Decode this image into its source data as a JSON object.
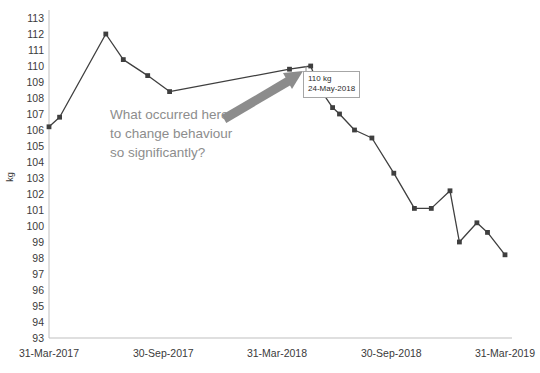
{
  "chart_data": {
    "type": "line",
    "title": "",
    "xlabel": "",
    "ylabel": "kg",
    "ylim": [
      93,
      113
    ],
    "grid": false,
    "legend": "none",
    "y_ticks": [
      113,
      112,
      111,
      110,
      109,
      108,
      107,
      106,
      105,
      104,
      103,
      102,
      101,
      100,
      99,
      98,
      97,
      96,
      95,
      94,
      93
    ],
    "x_ticks": [
      "31-Mar-2017",
      "30-Sep-2017",
      "31-Mar-2018",
      "30-Sep-2018",
      "31-Mar-2019"
    ],
    "x_range": [
      "31-Mar-2017",
      "31-Mar-2019"
    ],
    "series": [
      {
        "name": "Weight",
        "marker": "square",
        "color": "#3f3f3f",
        "points": [
          {
            "x": "31-Mar-2017",
            "y": 106.2
          },
          {
            "x": "17-Apr-2017",
            "y": 106.8
          },
          {
            "x": "30-Jun-2017",
            "y": 112.0
          },
          {
            "x": "28-Jul-2017",
            "y": 110.4
          },
          {
            "x": "05-Sep-2017",
            "y": 109.4
          },
          {
            "x": "10-Oct-2017",
            "y": 108.4
          },
          {
            "x": "20-Apr-2018",
            "y": 109.8
          },
          {
            "x": "24-May-2018",
            "y": 110.0
          },
          {
            "x": "07-Jun-2018",
            "y": 108.6
          },
          {
            "x": "28-Jun-2018",
            "y": 107.4
          },
          {
            "x": "09-Jul-2018",
            "y": 107.0
          },
          {
            "x": "02-Aug-2018",
            "y": 106.0
          },
          {
            "x": "30-Aug-2018",
            "y": 105.5
          },
          {
            "x": "04-Oct-2018",
            "y": 103.3
          },
          {
            "x": "06-Nov-2018",
            "y": 101.1
          },
          {
            "x": "03-Dec-2018",
            "y": 101.1
          },
          {
            "x": "02-Jan-2019",
            "y": 102.2
          },
          {
            "x": "17-Jan-2019",
            "y": 99.0
          },
          {
            "x": "14-Feb-2019",
            "y": 100.2
          },
          {
            "x": "03-Mar-2019",
            "y": 99.6
          },
          {
            "x": "31-Mar-2019",
            "y": 98.2
          }
        ]
      }
    ],
    "callout": {
      "value_label": "110 kg",
      "date_label": "24-May-2018",
      "points_to": {
        "x": "24-May-2018",
        "y": 110.0
      }
    },
    "annotation": {
      "lines": [
        "What occurred here",
        "to change behaviour",
        "so significantly?"
      ],
      "color": "#8d8d8d",
      "arrow": {
        "color": "#8c8c8c",
        "direction": "up-right"
      }
    }
  }
}
